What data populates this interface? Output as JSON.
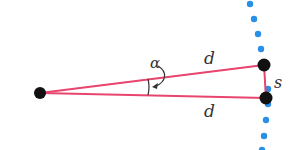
{
  "diagram": {
    "labels": {
      "alpha": "α",
      "d_top": "d",
      "d_bottom": "d",
      "s": "s"
    },
    "colors": {
      "lines": "#e8456e",
      "points": "#111111",
      "dots": "#2a8fe6",
      "text": "#333333"
    },
    "points": {
      "apex": [
        40,
        93
      ],
      "top": [
        264,
        65
      ],
      "bottom": [
        266,
        98
      ]
    }
  }
}
